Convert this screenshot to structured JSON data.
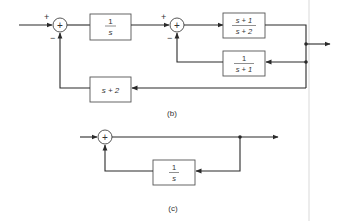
{
  "diagram_b": {
    "label": "(b)",
    "sum1": {
      "symbol": "+",
      "in_sign": "+",
      "fb_sign": "−"
    },
    "block_integrator": {
      "num": "1",
      "den": "s"
    },
    "sum2": {
      "symbol": "+",
      "in_sign": "+",
      "fb_sign": "−"
    },
    "block_forward": {
      "num": "s + 1",
      "den": "s + 2"
    },
    "block_inner_feedback": {
      "num": "1",
      "den": "s + 1"
    },
    "block_outer_feedback": {
      "expr": "s + 2"
    }
  },
  "diagram_c": {
    "label": "(c)",
    "sum": {
      "symbol": "+"
    },
    "block_feedback": {
      "num": "1",
      "den": "s"
    }
  },
  "colors": {
    "line": "#2a2a2a",
    "background": "#ffffff"
  }
}
